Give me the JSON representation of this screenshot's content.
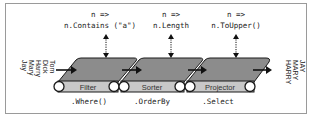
{
  "diagram": {
    "title": "",
    "input_items": [
      "Tom",
      "Dick",
      "Harry",
      "Mary",
      "Jay"
    ],
    "output_items": [
      "JAY",
      "MARY",
      "HARRY"
    ],
    "stages": [
      {
        "name": "Filter",
        "operator": ".Where()",
        "lambda_param": "n =>",
        "lambda_body": "n.Contains (\"a\")"
      },
      {
        "name": "Sorter",
        "operator": ".OrderBy",
        "lambda_param": "n =>",
        "lambda_body": "n.Length"
      },
      {
        "name": "Projector",
        "operator": ".Select",
        "lambda_param": "n =>",
        "lambda_body": "n.ToUpper()"
      }
    ],
    "colors": {
      "belt_top": "#8c8c8c",
      "belt_band": "#c8c8c8",
      "outline": "#1a1a1a",
      "frame": "#9a9a9a"
    }
  }
}
